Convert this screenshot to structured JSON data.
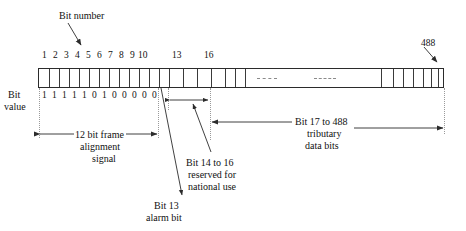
{
  "diagram": {
    "title_label": "Bit number",
    "bit_value_label_line1": "Bit",
    "bit_value_label_line2": "value",
    "end_bit_label": "488",
    "bit_numbers": [
      "1",
      "2",
      "3",
      "4",
      "5",
      "6",
      "7",
      "8",
      "9",
      "10",
      "13",
      "16"
    ],
    "bit_values": [
      "1",
      "1",
      "1",
      "1",
      "1",
      "0",
      "1",
      "0",
      "0",
      "0",
      "0",
      "0"
    ],
    "annotations": {
      "frame_alignment": {
        "line1": "12 bit frame",
        "line2": "alignment",
        "line3": "signal"
      },
      "alarm_bit": {
        "line1": "Bit 13",
        "line2": "alarm bit"
      },
      "national_use": {
        "line1": "Bit 14 to 16",
        "line2": "reserved for",
        "line3": "national use"
      },
      "tributary": {
        "line1": "Bit 17 to 488",
        "line2": "tributary",
        "line3": "data bits"
      }
    },
    "colors": {
      "stroke": "#2b2b2b",
      "guide": "#9a9a9a",
      "text": "#111111",
      "background": "#ffffff"
    }
  }
}
